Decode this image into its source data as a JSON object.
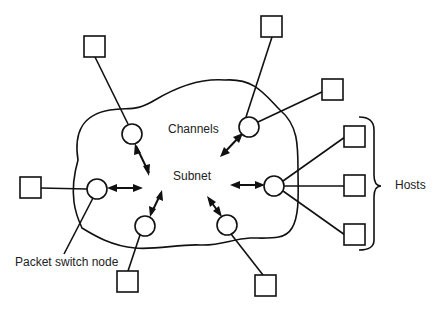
{
  "diagram": {
    "type": "network-topology",
    "labels": {
      "channels": "Channels",
      "subnet": "Subnet",
      "packet_switch_node": "Packet switch node",
      "hosts": "Hosts"
    },
    "colors": {
      "stroke": "#111111",
      "text": "#222222",
      "background": "#ffffff"
    },
    "nodes": [
      {
        "id": "node-top-left",
        "cx": 132,
        "cy": 134
      },
      {
        "id": "node-top-right",
        "cx": 249,
        "cy": 127
      },
      {
        "id": "node-left",
        "cx": 97,
        "cy": 189
      },
      {
        "id": "node-bottom-left",
        "cx": 145,
        "cy": 226
      },
      {
        "id": "node-bottom-right",
        "cx": 227,
        "cy": 225
      },
      {
        "id": "node-right",
        "cx": 274,
        "cy": 186
      }
    ],
    "hosts": [
      {
        "id": "host-1",
        "x": 84,
        "y": 36,
        "node": "node-top-left"
      },
      {
        "id": "host-2",
        "x": 261,
        "y": 16,
        "node": "node-top-right"
      },
      {
        "id": "host-3",
        "x": 322,
        "y": 79,
        "node": "node-top-right"
      },
      {
        "id": "host-4",
        "x": 20,
        "y": 177,
        "node": "node-left"
      },
      {
        "id": "host-5",
        "x": 117,
        "y": 271,
        "node": "node-bottom-left"
      },
      {
        "id": "host-6",
        "x": 255,
        "y": 275,
        "node": "node-bottom-right"
      },
      {
        "id": "host-7",
        "x": 344,
        "y": 126,
        "node": "node-right"
      },
      {
        "id": "host-8",
        "x": 344,
        "y": 175,
        "node": "node-right"
      },
      {
        "id": "host-9",
        "x": 344,
        "y": 224,
        "node": "node-right"
      }
    ]
  }
}
